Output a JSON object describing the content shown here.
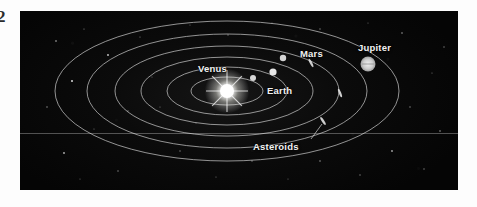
{
  "figure": {
    "kind": "astronomy-orbit-diagram",
    "margin_glyph": "2",
    "background_color": "#070707",
    "orbit_line_color": "#c9c9c9",
    "label_color": "#f2f2f2"
  },
  "sun": {
    "name": "Sun",
    "color": "#ffffff",
    "cx": 207,
    "cy": 80,
    "radius": 7
  },
  "orbits": [
    {
      "name": "mercury-orbit",
      "rx": 36,
      "ry": 14
    },
    {
      "name": "venus-orbit",
      "rx": 60,
      "ry": 24
    },
    {
      "name": "earth-orbit",
      "rx": 86,
      "ry": 34
    },
    {
      "name": "mars-orbit",
      "rx": 112,
      "ry": 45
    },
    {
      "name": "asteroid-belt-orbit",
      "rx": 140,
      "ry": 57
    },
    {
      "name": "jupiter-orbit",
      "rx": 172,
      "ry": 70
    }
  ],
  "planets": [
    {
      "name": "Venus",
      "cx": 233,
      "cy": 67,
      "radius": 3.0,
      "color": "#d8d8d8",
      "label": "Venus",
      "label_x": 178,
      "label_y": 52
    },
    {
      "name": "Earth",
      "cx": 253,
      "cy": 61,
      "radius": 3.6,
      "color": "#e6e6e6",
      "label": "Earth",
      "label_x": 247,
      "label_y": 74
    },
    {
      "name": "Mars",
      "cx": 263,
      "cy": 47,
      "radius": 3.2,
      "color": "#d4d4d4",
      "label": "Mars",
      "label_x": 280,
      "label_y": 37
    },
    {
      "name": "Jupiter",
      "cx": 348,
      "cy": 53,
      "radius": 7.5,
      "color": "#cfcfcf",
      "label": "Jupiter",
      "label_x": 338,
      "label_y": 31
    }
  ],
  "asteroids": {
    "label": "Asteroids",
    "label_x": 233,
    "label_y": 130,
    "leader_from": {
      "x": 291,
      "y": 128
    },
    "leader_to": {
      "x": 302,
      "y": 113
    },
    "markers": [
      {
        "name": "asteroid-tick-upper",
        "x": 291,
        "y": 52,
        "angle": -28
      },
      {
        "name": "asteroid-tick-right",
        "x": 320,
        "y": 82,
        "angle": -22
      },
      {
        "name": "asteroid-tick-lower",
        "x": 303,
        "y": 110,
        "angle": -34
      }
    ]
  },
  "stars": [
    {
      "x": 36,
      "y": 30,
      "r": 0.8,
      "o": 0.75
    },
    {
      "x": 64,
      "y": 18,
      "r": 0.6,
      "o": 0.55
    },
    {
      "x": 88,
      "y": 44,
      "r": 0.9,
      "o": 0.8
    },
    {
      "x": 120,
      "y": 26,
      "r": 0.6,
      "o": 0.5
    },
    {
      "x": 52,
      "y": 70,
      "r": 1.0,
      "o": 0.85
    },
    {
      "x": 27,
      "y": 96,
      "r": 0.7,
      "o": 0.6
    },
    {
      "x": 74,
      "y": 118,
      "r": 0.6,
      "o": 0.45
    },
    {
      "x": 44,
      "y": 142,
      "r": 0.9,
      "o": 0.7
    },
    {
      "x": 98,
      "y": 160,
      "r": 0.7,
      "o": 0.55
    },
    {
      "x": 140,
      "y": 96,
      "r": 0.6,
      "o": 0.45
    },
    {
      "x": 160,
      "y": 140,
      "r": 0.7,
      "o": 0.5
    },
    {
      "x": 196,
      "y": 166,
      "r": 0.6,
      "o": 0.45
    },
    {
      "x": 232,
      "y": 150,
      "r": 0.7,
      "o": 0.5
    },
    {
      "x": 268,
      "y": 168,
      "r": 0.6,
      "o": 0.4
    },
    {
      "x": 300,
      "y": 150,
      "r": 0.8,
      "o": 0.55
    },
    {
      "x": 340,
      "y": 164,
      "r": 0.7,
      "o": 0.5
    },
    {
      "x": 372,
      "y": 140,
      "r": 0.9,
      "o": 0.65
    },
    {
      "x": 404,
      "y": 158,
      "r": 0.7,
      "o": 0.5
    },
    {
      "x": 420,
      "y": 120,
      "r": 0.8,
      "o": 0.6
    },
    {
      "x": 390,
      "y": 96,
      "r": 0.7,
      "o": 0.55
    },
    {
      "x": 412,
      "y": 62,
      "r": 0.6,
      "o": 0.45
    },
    {
      "x": 382,
      "y": 22,
      "r": 0.8,
      "o": 0.6
    },
    {
      "x": 348,
      "y": 12,
      "r": 0.6,
      "o": 0.4
    },
    {
      "x": 300,
      "y": 18,
      "r": 0.7,
      "o": 0.5
    },
    {
      "x": 252,
      "y": 12,
      "r": 0.6,
      "o": 0.4
    },
    {
      "x": 208,
      "y": 24,
      "r": 0.7,
      "o": 0.45
    },
    {
      "x": 170,
      "y": 14,
      "r": 0.6,
      "o": 0.4
    },
    {
      "x": 132,
      "y": 66,
      "r": 0.6,
      "o": 0.4
    },
    {
      "x": 108,
      "y": 100,
      "r": 0.7,
      "o": 0.45
    },
    {
      "x": 176,
      "y": 112,
      "r": 0.6,
      "o": 0.4
    },
    {
      "x": 424,
      "y": 36,
      "r": 0.7,
      "o": 0.5
    },
    {
      "x": 60,
      "y": 168,
      "r": 0.6,
      "o": 0.4
    }
  ]
}
